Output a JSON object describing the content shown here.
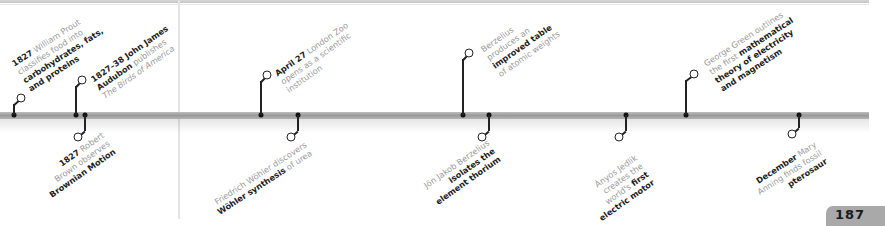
{
  "page": {
    "number": "187",
    "bar_color": "#a4a4a4",
    "muted_text_color": "#9a9a9a",
    "emphasis_text_color": "#1c1c1c"
  },
  "events": [
    {
      "id": "prout",
      "side": "top",
      "lines": [
        [
          {
            "t": "1827",
            "b": true
          },
          {
            "t": " William Prout"
          }
        ],
        [
          {
            "t": "classifies food into"
          }
        ],
        [
          {
            "t": "carbohydrates, fats,",
            "b": true
          }
        ],
        [
          {
            "t": "and proteins",
            "b": true
          }
        ]
      ]
    },
    {
      "id": "audubon",
      "side": "top",
      "lines": [
        [
          {
            "t": "1827–38 John James",
            "b": true
          }
        ],
        [
          {
            "t": "Audubon",
            "b": true
          },
          {
            "t": " publishes"
          }
        ],
        [
          {
            "t": "The Birds of America",
            "i": true
          }
        ]
      ]
    },
    {
      "id": "brown",
      "side": "bottom",
      "lines": [
        [
          {
            "t": "1827",
            "b": true
          },
          {
            "t": " Robert"
          }
        ],
        [
          {
            "t": "Brown observes"
          }
        ],
        [
          {
            "t": "Brownian Motion",
            "b": true
          }
        ]
      ]
    },
    {
      "id": "london-zoo",
      "side": "top",
      "lines": [
        [
          {
            "t": "April 27",
            "b": true
          },
          {
            "t": " London Zoo"
          }
        ],
        [
          {
            "t": "opens as a scientific"
          }
        ],
        [
          {
            "t": "institution"
          }
        ]
      ]
    },
    {
      "id": "wohler",
      "side": "bottom",
      "lines": [
        [
          {
            "t": "Friedrich Wöhler discovers"
          }
        ],
        [
          {
            "t": "Wöhler synthesis",
            "b": true
          },
          {
            "t": " of urea"
          }
        ]
      ]
    },
    {
      "id": "berzelius-table",
      "side": "top",
      "lines": [
        [
          {
            "t": "Berzelius"
          }
        ],
        [
          {
            "t": "produces an"
          }
        ],
        [
          {
            "t": "improved table",
            "b": true
          }
        ],
        [
          {
            "t": "of atomic weights"
          }
        ]
      ]
    },
    {
      "id": "berzelius-thorium",
      "side": "bottom",
      "lines": [
        [
          {
            "t": "Jön Jakob Berzelius"
          }
        ],
        [
          {
            "t": "isolates the",
            "b": true
          }
        ],
        [
          {
            "t": "element thorium",
            "b": true
          }
        ]
      ]
    },
    {
      "id": "jedlik",
      "side": "bottom",
      "lines": [
        [
          {
            "t": "Ányos Jedlik"
          }
        ],
        [
          {
            "t": "creates the"
          }
        ],
        [
          {
            "t": "world's "
          },
          {
            "t": "first",
            "b": true
          }
        ],
        [
          {
            "t": "electric motor",
            "b": true
          }
        ]
      ]
    },
    {
      "id": "green",
      "side": "top",
      "lines": [
        [
          {
            "t": "George Green outlines"
          }
        ],
        [
          {
            "t": "the first "
          },
          {
            "t": "mathematical",
            "b": true
          }
        ],
        [
          {
            "t": "theory of electricity",
            "b": true
          }
        ],
        [
          {
            "t": "and magnetism",
            "b": true
          }
        ]
      ]
    },
    {
      "id": "anning",
      "side": "bottom",
      "lines": [
        [
          {
            "t": "December",
            "b": true
          },
          {
            "t": " Mary"
          }
        ],
        [
          {
            "t": "Anning finds fossil"
          }
        ],
        [
          {
            "t": "pterosaur",
            "b": true
          }
        ]
      ]
    }
  ]
}
